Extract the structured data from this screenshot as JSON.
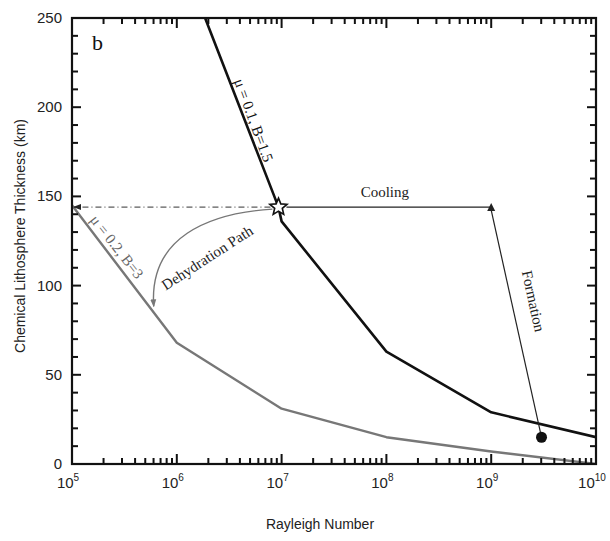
{
  "chart_data": {
    "type": "line",
    "panel_label": "b",
    "title": "",
    "xlabel": "Rayleigh Number",
    "ylabel": "Chemical Lithosphere Thickness (km)",
    "xscale": "log",
    "xlim": [
      100000,
      10000000000
    ],
    "ylim": [
      0,
      250
    ],
    "x_tick_labels": [
      {
        "base": "10",
        "exp": "5",
        "value": 100000
      },
      {
        "base": "10",
        "exp": "6",
        "value": 1000000
      },
      {
        "base": "10",
        "exp": "7",
        "value": 10000000
      },
      {
        "base": "10",
        "exp": "8",
        "value": 100000000
      },
      {
        "base": "10",
        "exp": "9",
        "value": 1000000000
      },
      {
        "base": "10",
        "exp": "10",
        "value": 10000000000
      }
    ],
    "y_tick_labels": [
      "0",
      "50",
      "100",
      "150",
      "200",
      "250"
    ],
    "y_ticks": [
      0,
      50,
      100,
      150,
      200,
      250
    ],
    "grid": false,
    "legend": null,
    "series": [
      {
        "name": "μ = 0.1, B=1.5",
        "color": "#111111",
        "log10_x": [
          6.27,
          6.97,
          7.0,
          8.0,
          9.0,
          10.0
        ],
        "y": [
          250,
          144,
          136,
          63,
          29,
          15
        ]
      },
      {
        "name": "μ = 0.2, B=3",
        "color": "#777777",
        "log10_x": [
          5.0,
          6.0,
          7.0,
          8.0,
          9.0,
          10.0
        ],
        "y": [
          145,
          68,
          31,
          15,
          7,
          0
        ]
      }
    ],
    "annotations": [
      {
        "text": "μ = 0.1, B=1.5",
        "type": "curve-label"
      },
      {
        "text": "μ = 0.2, B=3",
        "type": "curve-label"
      },
      {
        "text": "Cooling",
        "type": "arrow",
        "from_log10_x": 9.0,
        "from_y": 144,
        "to_log10_x": 6.97,
        "to_y": 144,
        "note": "arrow head drawn at 10^9 end; line from star to 10^9"
      },
      {
        "text": "Formation",
        "type": "arrow",
        "from_log10_x": 9.48,
        "from_y": 15,
        "to_log10_x": 9.0,
        "to_y": 144
      },
      {
        "text": "Dehydration Path",
        "type": "curved-arrow",
        "from_log10_x": 6.97,
        "from_y": 144,
        "to_log10_x": 5.78,
        "to_y": 85
      },
      {
        "text": "",
        "type": "dash-dot-arrow",
        "from_log10_x": 6.97,
        "from_y": 144,
        "to_log10_x": 5.0,
        "to_y": 144
      },
      {
        "text": "",
        "type": "star-marker",
        "log10_x": 6.97,
        "y": 144
      },
      {
        "text": "",
        "type": "filled-circle-marker",
        "log10_x": 9.48,
        "y": 15
      }
    ]
  }
}
